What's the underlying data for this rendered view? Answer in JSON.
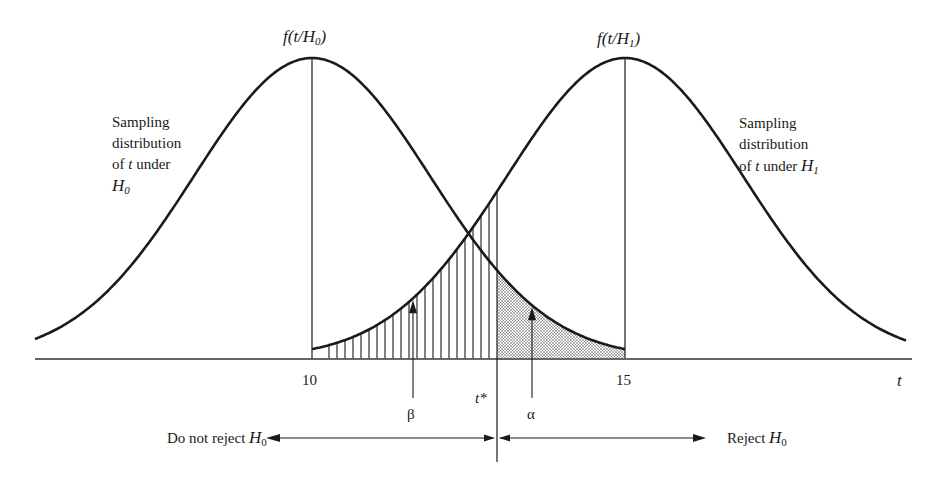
{
  "chart_data": {
    "type": "diagram",
    "xlabel": "t",
    "x_ticks": [
      {
        "value": 10,
        "label": "10"
      },
      {
        "value": 15,
        "label": "15"
      }
    ],
    "distributions": [
      {
        "name": "H0",
        "mean": 10,
        "peak_label_prefix": "f(t/H",
        "peak_label_sub": "0",
        "peak_label_suffix": ")",
        "description_lines": [
          "Sampling",
          "distribution",
          "of t under",
          "H0"
        ]
      },
      {
        "name": "H1",
        "mean": 15,
        "peak_label_prefix": "f(t/H",
        "peak_label_sub": "1",
        "peak_label_suffix": ")",
        "description_lines": [
          "Sampling",
          "distribution",
          "of t under H1"
        ]
      }
    ],
    "critical_value": {
      "label": "t*",
      "approx_value": 12.8
    },
    "regions": [
      {
        "name": "beta",
        "symbol": "β",
        "description": "Type II error area under H1 left of t* (vertical hatching)"
      },
      {
        "name": "alpha",
        "symbol": "α",
        "description": "Type I error area under H0 right of t* (dotted shading)"
      }
    ],
    "decision": {
      "left": {
        "label": "Do not reject",
        "sym": "H",
        "sub": "0"
      },
      "right": {
        "label": "Reject",
        "sym": "H",
        "sub": "0"
      }
    }
  },
  "labels": {
    "h0_peak": {
      "prefix": "f(t/H",
      "sub": "0",
      "suffix": ")"
    },
    "h1_peak": {
      "prefix": "f(t/H",
      "sub": "1",
      "suffix": ")"
    },
    "h0_desc": {
      "l1": "Sampling",
      "l2": "distribution",
      "l3a": "of ",
      "l3t": "t",
      "l3b": " under",
      "l4": "H",
      "l4sub": "0"
    },
    "h1_desc": {
      "l1": "Sampling",
      "l2": "distribution",
      "l3a": "of ",
      "l3t": "t",
      "l3b": " under ",
      "l3h": "H",
      "l3sub": "1"
    },
    "tick_10": "10",
    "tick_15": "15",
    "axis_t": "t",
    "tstar": "t*",
    "beta": "β",
    "alpha": "α",
    "do_not_reject": "Do not reject ",
    "do_not_reject_h": "H",
    "do_not_reject_sub": "0",
    "reject": "Reject ",
    "reject_h": "H",
    "reject_sub": "0"
  },
  "geometry": {
    "baseline_y": 358,
    "peak_y": 58,
    "h0_center_x": 312,
    "h1_center_x": 625,
    "sigma_px": 118,
    "axis_x0": 35,
    "axis_x1": 912,
    "tstar_x": 497,
    "beta_arrow_x": 413,
    "alpha_arrow_x": 532
  }
}
